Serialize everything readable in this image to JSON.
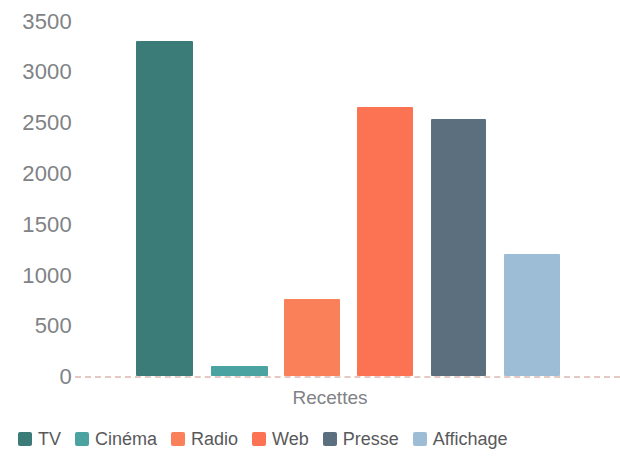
{
  "chart_data": {
    "type": "bar",
    "title": "",
    "subtitle": "",
    "xlabel": "Recettes",
    "ylabel": "",
    "categories": [
      "TV",
      "Cinéma",
      "Radio",
      "Web",
      "Presse",
      "Affichage"
    ],
    "values": [
      3310,
      100,
      760,
      2660,
      2540,
      1210
    ],
    "series": [
      {
        "name": "Recettes",
        "values": [
          3310,
          100,
          760,
          2660,
          2540,
          1210
        ]
      }
    ],
    "colors": [
      "#3b7b78",
      "#4aa3a0",
      "#fa8059",
      "#fb7352",
      "#5c6f7e",
      "#9dbdd6"
    ],
    "ylim": [
      0,
      3500
    ],
    "yticks": [
      0,
      500,
      1000,
      1500,
      2000,
      2500,
      3000,
      3500
    ],
    "ytick_labels": [
      "0",
      "500",
      "1000",
      "1500",
      "2000",
      "2500",
      "3000",
      "3500"
    ],
    "xticks": [],
    "xtick_labels": [],
    "grid": "baseline-dashed-only",
    "legend_position": "bottom-left",
    "legend": [
      {
        "label": "TV",
        "color": "#3b7b78"
      },
      {
        "label": "Cinéma",
        "color": "#4aa3a0"
      },
      {
        "label": "Radio",
        "color": "#fa8059"
      },
      {
        "label": "Web",
        "color": "#fb7352"
      },
      {
        "label": "Presse",
        "color": "#5c6f7e"
      },
      {
        "label": "Affichage",
        "color": "#9dbdd6"
      }
    ],
    "annotations": []
  },
  "axis": {
    "y_tick_labels": [
      "3500",
      "3000",
      "2500",
      "2000",
      "1500",
      "1000",
      "500",
      "0"
    ],
    "x_title": "Recettes"
  },
  "legend": {
    "items": [
      {
        "label": "TV",
        "color": "#3b7b78"
      },
      {
        "label": "Cinéma",
        "color": "#4aa3a0"
      },
      {
        "label": "Radio",
        "color": "#fa8059"
      },
      {
        "label": "Web",
        "color": "#fb7352"
      },
      {
        "label": "Presse",
        "color": "#5c6f7e"
      },
      {
        "label": "Affichage",
        "color": "#9dbdd6"
      }
    ]
  },
  "style": {
    "background": "#ffffff",
    "tick_color": "#808285",
    "legend_text_color": "#58595b",
    "baseline_color": "#e3c9c1"
  }
}
